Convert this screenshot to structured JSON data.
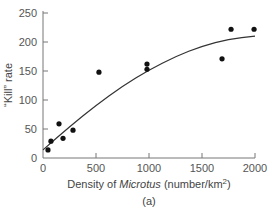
{
  "chart_data": {
    "type": "scatter",
    "title": "",
    "xlabel_parts": [
      "Density of ",
      "Microtus",
      " (number/km",
      "2",
      ")"
    ],
    "xlabel": "Density of Microtus (number/km²)",
    "ylabel": "“Kill” rate",
    "caption": "(a)",
    "xlim": [
      0,
      2000
    ],
    "ylim": [
      0,
      250
    ],
    "xticks": [
      0,
      500,
      1000,
      1500,
      2000
    ],
    "yticks": [
      0,
      50,
      100,
      150,
      200,
      250
    ],
    "grid": false,
    "legend": null,
    "series": [
      {
        "name": "observed",
        "type": "scatter",
        "x": [
          47,
          75,
          151,
          189,
          283,
          528,
          981,
          981,
          1689,
          1774,
          1991
        ],
        "y": [
          14,
          29,
          59,
          34,
          48,
          148,
          162,
          153,
          171,
          222,
          222
        ]
      },
      {
        "name": "fitted curve",
        "type": "line",
        "x": [
          0,
          250,
          500,
          750,
          1000,
          1250,
          1500,
          1750,
          2000
        ],
        "y": [
          14,
          54,
          91,
          124,
          152,
          175,
          193,
          205,
          210
        ]
      }
    ]
  }
}
